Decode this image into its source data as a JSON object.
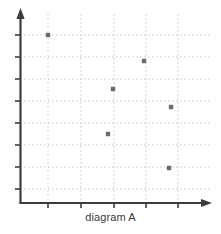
{
  "figure": {
    "caption": "diagram A",
    "background_color": "#ffffff",
    "axis_color": "#3c3c3c",
    "grid_color": "#c9c9c9",
    "point_color": "#6b6b6b"
  },
  "chart_data": {
    "type": "scatter",
    "title": "diagram A",
    "xlabel": "",
    "ylabel": "",
    "grid": true,
    "legend": null,
    "axes": {
      "x_axis_arrow": true,
      "y_axis_arrow": true,
      "x_tick_count": 5,
      "y_tick_count": 8,
      "x_tick_labels": [],
      "y_tick_labels": [],
      "xlim": [
        0,
        6
      ],
      "ylim": [
        0,
        8
      ]
    },
    "gridlines": {
      "vertical_px": [
        48,
        81,
        114,
        146,
        178
      ],
      "horizontal_px": [
        35,
        57,
        79,
        101,
        123,
        145,
        167,
        189
      ]
    },
    "points": [
      {
        "x": 1,
        "y": 7,
        "px": 48,
        "py": 35
      },
      {
        "x": 4,
        "y": 6,
        "px": 144,
        "py": 61
      },
      {
        "x": 3,
        "y": 5,
        "px": 113,
        "py": 89
      },
      {
        "x": 5,
        "y": 4,
        "px": 171,
        "py": 107
      },
      {
        "x": 3,
        "y": 3,
        "px": 108,
        "py": 134
      },
      {
        "x": 5,
        "y": 1,
        "px": 169,
        "py": 168
      }
    ],
    "point_count": 6
  }
}
